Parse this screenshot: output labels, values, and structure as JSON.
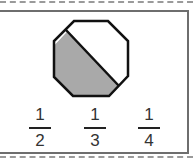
{
  "figure": {
    "shape": "octagon",
    "shaded_fraction_description": "octagon divided by a diagonal line, lower-left portion shaded gray",
    "colors": {
      "shaded": "#a9a9a9",
      "outline": "#111111",
      "frame": "#6e6e6e"
    }
  },
  "choices": [
    {
      "numerator": "1",
      "denominator": "2"
    },
    {
      "numerator": "1",
      "denominator": "3"
    },
    {
      "numerator": "1",
      "denominator": "4"
    }
  ]
}
